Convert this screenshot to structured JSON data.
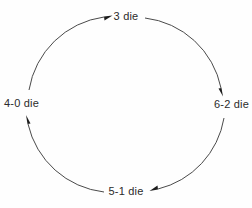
{
  "diagram": {
    "type": "cycle",
    "direction": "counter-clockwise",
    "stroke_color": "#4a4a4a",
    "text_color": "#2b2b2b",
    "background_color": "#ffffff",
    "nodes": [
      {
        "id": "top",
        "label": "3 die",
        "position": "top"
      },
      {
        "id": "right",
        "label": "6-2 die",
        "position": "right"
      },
      {
        "id": "bottom",
        "label": "5-1 die",
        "position": "bottom"
      },
      {
        "id": "left",
        "label": "4-0 die",
        "position": "left"
      }
    ],
    "edges": [
      {
        "from": "left",
        "to": "top",
        "arrow": "arrowhead-right"
      },
      {
        "from": "top",
        "to": "right",
        "arrow": "arrowhead-down"
      },
      {
        "from": "right",
        "to": "bottom",
        "arrow": "arrowhead-left"
      },
      {
        "from": "bottom",
        "to": "left",
        "arrow": "arrowhead-up"
      }
    ]
  }
}
